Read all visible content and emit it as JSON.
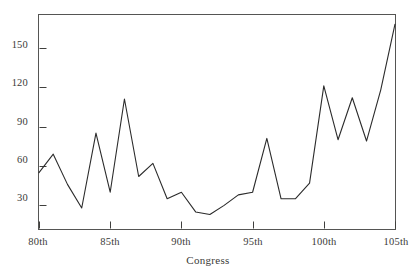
{
  "chart_data": {
    "type": "line",
    "title": "",
    "subtitle": "",
    "xlabel": "Congress",
    "ylabel": "",
    "grid": false,
    "legend": "none",
    "xlim": [
      80,
      105
    ],
    "ylim": [
      12,
      175
    ],
    "x_tick_labels": [
      "80th",
      "85th",
      "90th",
      "95th",
      "100th",
      "105th"
    ],
    "x_tick_values": [
      80,
      85,
      90,
      95,
      100,
      105
    ],
    "y_tick_labels": [
      "30",
      "60",
      "90",
      "120",
      "150"
    ],
    "y_tick_values": [
      30,
      60,
      90,
      120,
      150
    ],
    "line_color": "#2b2b2b",
    "frame_color": "#555553",
    "x": [
      80,
      81,
      82,
      83,
      84,
      85,
      86,
      87,
      88,
      89,
      90,
      91,
      92,
      93,
      94,
      95,
      96,
      97,
      98,
      99,
      100,
      101,
      102,
      103,
      104,
      105
    ],
    "values": [
      55,
      69,
      46,
      28,
      85,
      40,
      111,
      52,
      62,
      35,
      40,
      25,
      23,
      30,
      38,
      40,
      81,
      35,
      35,
      47,
      121,
      80,
      112,
      79,
      118,
      168
    ],
    "series": [
      {
        "name": "Count",
        "values": [
          55,
          69,
          46,
          28,
          85,
          40,
          111,
          52,
          62,
          35,
          40,
          25,
          23,
          30,
          38,
          40,
          81,
          35,
          35,
          47,
          121,
          80,
          112,
          79,
          118,
          168
        ]
      }
    ]
  },
  "axes": {
    "x_label": "Congress",
    "y_ticks": [
      {
        "label": "150"
      },
      {
        "label": "120"
      },
      {
        "label": "90"
      },
      {
        "label": "60"
      },
      {
        "label": "30"
      }
    ],
    "x_ticks": [
      {
        "label": "80th"
      },
      {
        "label": "85th"
      },
      {
        "label": "90th"
      },
      {
        "label": "95th"
      },
      {
        "label": "100th"
      },
      {
        "label": "105th"
      }
    ]
  }
}
